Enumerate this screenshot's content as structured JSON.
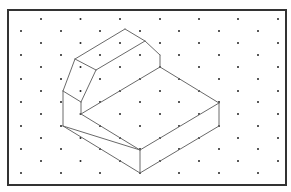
{
  "diagram": {
    "type": "isometric-dot-grid-drawing",
    "frame": {
      "x": 8,
      "y": 10,
      "width": 278,
      "height": 175
    },
    "colors": {
      "background": "#ffffff",
      "frame": "#333333",
      "dot": "#222222",
      "edge": "#6a6a6a"
    },
    "grid": {
      "row_y": [
        19,
        31,
        43,
        55,
        67,
        79,
        91,
        102,
        114,
        126,
        138,
        149,
        161,
        173
      ],
      "even_row_x": [
        41,
        80.5,
        120,
        160,
        199,
        238,
        278
      ],
      "odd_row_x": [
        21,
        61,
        100,
        140,
        179,
        219,
        258
      ],
      "dot_radius": 1
    },
    "shape": {
      "name": "stepped-block-with-chamfer",
      "edges": [
        [
          [
            125,
            29
          ],
          [
            145,
            41
          ]
        ],
        [
          [
            75,
            59
          ],
          [
            125,
            29
          ]
        ],
        [
          [
            75,
            59
          ],
          [
            96,
            70
          ]
        ],
        [
          [
            96,
            70
          ],
          [
            145,
            41
          ]
        ],
        [
          [
            145,
            41
          ],
          [
            160,
            55
          ]
        ],
        [
          [
            160,
            55
          ],
          [
            160,
            67
          ]
        ],
        [
          [
            75,
            59
          ],
          [
            63,
            91
          ]
        ],
        [
          [
            96,
            70
          ],
          [
            81,
            102
          ]
        ],
        [
          [
            63,
            91
          ],
          [
            81,
            102
          ]
        ],
        [
          [
            81,
            102
          ],
          [
            81,
            114
          ]
        ],
        [
          [
            81,
            114
          ],
          [
            160,
            67
          ]
        ],
        [
          [
            160,
            67
          ],
          [
            219,
            103
          ]
        ],
        [
          [
            63,
            91
          ],
          [
            63,
            126
          ]
        ],
        [
          [
            63,
            126
          ],
          [
            140,
            150
          ]
        ],
        [
          [
            81,
            114
          ],
          [
            140,
            150
          ]
        ],
        [
          [
            140,
            150
          ],
          [
            219,
            103
          ]
        ],
        [
          [
            140,
            150
          ],
          [
            140,
            173
          ]
        ],
        [
          [
            63,
            126
          ],
          [
            140,
            173
          ]
        ],
        [
          [
            140,
            173
          ],
          [
            219,
            126
          ]
        ],
        [
          [
            219,
            103
          ],
          [
            219,
            126
          ]
        ]
      ]
    }
  }
}
